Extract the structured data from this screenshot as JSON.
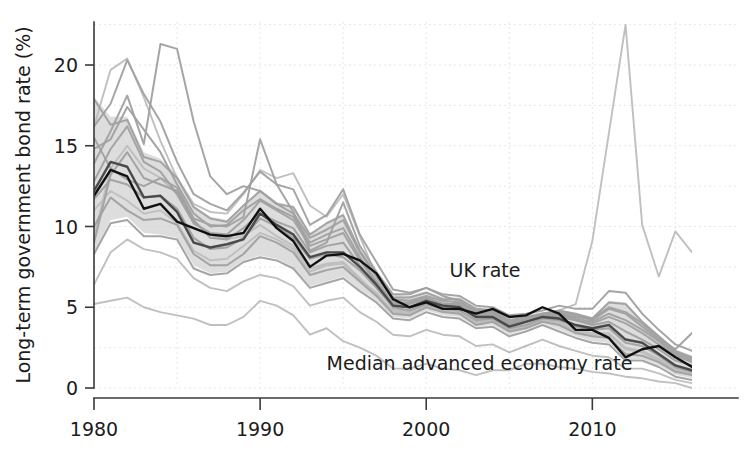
{
  "chart_data": {
    "type": "line",
    "title": "",
    "xlabel": "",
    "ylabel": "Long-term government bond rate (%)",
    "xlim": [
      1980,
      2016
    ],
    "ylim": [
      0,
      23
    ],
    "grid": true,
    "legend_position": "inline-annotations",
    "y_ticks": [
      0,
      5,
      10,
      15,
      20
    ],
    "y_tick_labels": [
      "0",
      "5",
      "10",
      "15",
      "20"
    ],
    "x_ticks": [
      1980,
      1990,
      2000,
      2010
    ],
    "x_tick_labels": [
      "1980",
      "1990",
      "2000",
      "2010"
    ],
    "y_gridlines": [
      2.5,
      7.5,
      12.5,
      17.5,
      22.5
    ],
    "x_gridlines": [
      1985,
      1995,
      2005,
      2015
    ],
    "colors": {
      "uk_line": "#111111",
      "median_line": "#4a4a4a",
      "country_line": "#a0a0a0",
      "country_line_light": "#bdbdbd",
      "band_fill": "#d2d2d2",
      "grid": "#d9dde2",
      "axis": "#3a3a3a",
      "text": "#1c1c1c",
      "background": "#ffffff"
    },
    "annotations": [
      {
        "name": "uk-rate-label",
        "text": "UK rate",
        "x": 2001.4,
        "y": 6.9
      },
      {
        "name": "median-rate-label",
        "text": "Median advanced economy rate",
        "x": 1994.0,
        "y": 1.1
      }
    ],
    "x": [
      1980,
      1981,
      1982,
      1983,
      1984,
      1985,
      1986,
      1987,
      1988,
      1989,
      1990,
      1991,
      1992,
      1993,
      1994,
      1995,
      1996,
      1997,
      1998,
      1999,
      2000,
      2001,
      2002,
      2003,
      2004,
      2005,
      2006,
      2007,
      2008,
      2009,
      2010,
      2011,
      2012,
      2013,
      2014,
      2015,
      2016
    ],
    "band": {
      "name": "Interquartile range of advanced economies",
      "lower": [
        8.4,
        10.4,
        10.6,
        9.6,
        9.5,
        9.3,
        7.6,
        7.1,
        7.2,
        7.9,
        8.2,
        8.0,
        7.5,
        6.3,
        6.6,
        6.9,
        6.1,
        5.4,
        4.4,
        4.3,
        4.8,
        4.5,
        4.4,
        3.8,
        3.9,
        3.3,
        3.6,
        4.0,
        3.6,
        3.2,
        2.9,
        2.8,
        1.8,
        1.8,
        1.4,
        0.8,
        0.6
      ],
      "upper": [
        18.0,
        16.8,
        16.8,
        14.6,
        14.2,
        13.2,
        11.3,
        10.6,
        10.4,
        11.3,
        12.3,
        11.5,
        11.3,
        9.6,
        10.2,
        10.8,
        8.6,
        7.1,
        5.8,
        5.7,
        6.0,
        5.6,
        5.6,
        5.0,
        4.9,
        4.3,
        4.5,
        4.7,
        4.8,
        4.6,
        4.4,
        5.4,
        5.3,
        4.2,
        3.3,
        2.4,
        2.0
      ]
    },
    "series": [
      {
        "name": "UK rate",
        "style": "uk",
        "values": [
          11.9,
          13.5,
          13.1,
          11.1,
          11.4,
          10.3,
          9.9,
          9.5,
          9.4,
          9.6,
          11.1,
          9.9,
          9.1,
          7.5,
          8.2,
          8.3,
          7.9,
          7.1,
          5.5,
          5.0,
          5.3,
          4.9,
          4.9,
          4.6,
          4.9,
          4.4,
          4.5,
          5.0,
          4.6,
          3.6,
          3.6,
          3.1,
          1.9,
          2.4,
          2.6,
          1.9,
          1.3
        ]
      },
      {
        "name": "Median advanced economy rate",
        "style": "median",
        "values": [
          12.2,
          14.0,
          13.7,
          11.8,
          11.9,
          10.9,
          9.0,
          8.7,
          8.9,
          9.2,
          10.8,
          10.1,
          9.5,
          8.1,
          8.4,
          8.4,
          7.5,
          6.4,
          5.1,
          5.0,
          5.4,
          5.1,
          5.0,
          4.4,
          4.4,
          3.8,
          4.1,
          4.4,
          4.3,
          3.9,
          3.7,
          3.9,
          3.0,
          2.8,
          2.1,
          1.4,
          1.1
        ]
      },
      {
        "name": "Country series 1",
        "style": "country",
        "values": [
          17.9,
          16.3,
          16.6,
          14.3,
          14.0,
          13.0,
          11.2,
          10.5,
          10.3,
          11.3,
          12.2,
          11.4,
          11.2,
          9.5,
          10.2,
          10.7,
          8.5,
          7.0,
          5.6,
          5.6,
          5.9,
          5.5,
          5.5,
          4.9,
          4.8,
          4.2,
          4.4,
          4.6,
          4.8,
          4.6,
          4.3,
          5.3,
          5.2,
          4.1,
          3.2,
          2.3,
          1.9
        ]
      },
      {
        "name": "Country series 2",
        "style": "country",
        "values": [
          16.2,
          17.6,
          20.3,
          18.2,
          16.5,
          14.0,
          12.0,
          11.4,
          11.0,
          12.1,
          13.4,
          12.6,
          12.3,
          10.1,
          10.7,
          12.3,
          9.5,
          7.8,
          6.1,
          5.9,
          6.2,
          5.8,
          5.7,
          5.1,
          5.0,
          4.5,
          4.6,
          4.8,
          5.1,
          4.9,
          4.9,
          6.0,
          5.9,
          4.6,
          3.6,
          2.7,
          2.3
        ]
      },
      {
        "name": "Country series 3",
        "style": "country",
        "values": [
          14.8,
          15.4,
          17.4,
          16.0,
          14.6,
          12.6,
          10.8,
          10.0,
          10.1,
          11.0,
          11.7,
          11.1,
          10.6,
          9.0,
          9.5,
          9.9,
          8.1,
          6.6,
          5.3,
          5.3,
          5.6,
          5.2,
          5.2,
          4.6,
          4.6,
          4.0,
          4.2,
          4.5,
          4.6,
          4.3,
          4.1,
          4.6,
          4.2,
          3.6,
          2.9,
          2.1,
          1.7
        ]
      },
      {
        "name": "Country series 4",
        "style": "country",
        "values": [
          13.9,
          15.9,
          18.1,
          15.1,
          21.3,
          21.0,
          16.5,
          13.1,
          12.0,
          12.5,
          12.2,
          11.4,
          10.8,
          9.3,
          9.8,
          10.4,
          8.4,
          6.9,
          5.5,
          5.4,
          5.7,
          5.4,
          5.3,
          4.8,
          4.7,
          4.1,
          4.3,
          4.6,
          4.7,
          4.5,
          4.2,
          4.9,
          4.6,
          3.8,
          3.0,
          2.2,
          1.8
        ]
      },
      {
        "name": "Country series 5",
        "style": "country",
        "values": [
          9.0,
          13.2,
          14.6,
          13.0,
          12.6,
          12.2,
          10.4,
          9.3,
          9.2,
          9.9,
          10.8,
          10.3,
          9.9,
          8.4,
          8.8,
          9.0,
          7.6,
          6.3,
          5.1,
          5.0,
          5.4,
          5.0,
          5.0,
          4.4,
          4.4,
          3.9,
          4.1,
          4.4,
          4.4,
          4.2,
          3.9,
          4.1,
          3.5,
          3.0,
          2.4,
          1.7,
          1.4
        ]
      },
      {
        "name": "Country series 6",
        "style": "country",
        "values": [
          11.7,
          12.9,
          12.6,
          11.8,
          11.9,
          11.1,
          9.3,
          8.6,
          8.7,
          9.3,
          10.5,
          10.0,
          9.3,
          8.0,
          8.3,
          8.1,
          7.3,
          6.2,
          5.0,
          4.8,
          5.2,
          4.9,
          4.8,
          4.2,
          4.3,
          3.7,
          3.9,
          4.3,
          4.2,
          3.8,
          3.6,
          3.7,
          2.8,
          2.6,
          2.0,
          1.3,
          1.0
        ]
      },
      {
        "name": "Country series 7",
        "style": "country",
        "values": [
          10.0,
          11.8,
          11.0,
          10.4,
          10.5,
          10.1,
          8.3,
          7.6,
          7.6,
          8.3,
          9.4,
          9.0,
          8.4,
          7.0,
          7.3,
          7.5,
          6.6,
          5.7,
          4.6,
          4.5,
          5.0,
          4.7,
          4.6,
          3.9,
          4.1,
          3.5,
          3.7,
          4.1,
          3.9,
          3.4,
          3.2,
          3.1,
          2.1,
          2.0,
          1.6,
          1.0,
          0.8
        ]
      },
      {
        "name": "Country series 8",
        "style": "country",
        "values": [
          8.3,
          10.2,
          10.4,
          9.4,
          9.4,
          9.2,
          7.4,
          7.0,
          7.1,
          7.8,
          8.1,
          7.9,
          7.4,
          6.2,
          6.5,
          6.8,
          6.0,
          5.3,
          4.3,
          4.2,
          4.7,
          4.4,
          4.3,
          3.7,
          3.8,
          3.2,
          3.5,
          3.9,
          3.5,
          3.1,
          2.8,
          2.7,
          1.7,
          1.7,
          1.3,
          0.7,
          0.5
        ]
      },
      {
        "name": "Country series 9",
        "style": "country-light",
        "values": [
          5.2,
          5.4,
          5.6,
          5.0,
          4.7,
          4.5,
          4.3,
          3.9,
          3.9,
          4.4,
          5.4,
          5.1,
          4.5,
          3.3,
          3.7,
          2.9,
          2.5,
          2.0,
          1.2,
          1.2,
          1.5,
          1.2,
          1.1,
          0.8,
          1.1,
          1.1,
          1.5,
          1.5,
          1.3,
          1.2,
          1.0,
          0.9,
          0.7,
          0.6,
          0.4,
          0.3,
          0.0
        ]
      },
      {
        "name": "Country series 10",
        "style": "country-light",
        "values": [
          9.4,
          13.6,
          15.0,
          13.6,
          13.0,
          12.0,
          10.3,
          9.5,
          9.2,
          9.4,
          10.1,
          9.4,
          8.8,
          7.4,
          7.7,
          7.8,
          6.8,
          5.8,
          4.8,
          4.7,
          5.1,
          4.8,
          4.7,
          4.1,
          4.2,
          3.6,
          3.8,
          4.2,
          4.1,
          3.6,
          3.4,
          3.4,
          2.5,
          2.3,
          1.8,
          1.2,
          1.0
        ]
      },
      {
        "name": "Country series 11 (peripheral spike)",
        "style": "country-light",
        "values": [
          16.2,
          19.7,
          20.4,
          18.0,
          15.3,
          13.0,
          11.4,
          10.9,
          10.8,
          12.0,
          13.5,
          13.0,
          13.3,
          11.3,
          10.6,
          12.0,
          9.4,
          6.9,
          4.9,
          4.7,
          5.5,
          5.3,
          5.1,
          4.3,
          4.3,
          3.6,
          4.1,
          4.5,
          4.8,
          5.2,
          9.1,
          15.8,
          22.5,
          10.1,
          6.9,
          9.7,
          8.4
        ]
      },
      {
        "name": "Country series 12",
        "style": "country",
        "values": [
          12.8,
          14.8,
          16.2,
          14.0,
          13.4,
          12.0,
          10.2,
          9.6,
          9.5,
          10.4,
          11.6,
          11.0,
          10.4,
          8.8,
          9.2,
          9.6,
          7.9,
          6.5,
          5.2,
          5.2,
          5.5,
          5.1,
          5.1,
          4.5,
          4.5,
          3.9,
          4.2,
          4.5,
          4.5,
          4.2,
          4.0,
          4.4,
          4.0,
          3.4,
          2.7,
          2.0,
          1.6
        ]
      },
      {
        "name": "Country series 13",
        "style": "country",
        "values": [
          15.5,
          13.6,
          12.9,
          12.5,
          13.0,
          12.4,
          10.5,
          10.1,
          10.0,
          10.6,
          15.4,
          12.6,
          10.9,
          8.5,
          9.0,
          11.5,
          8.8,
          7.2,
          5.8,
          5.8,
          6.2,
          5.7,
          5.4,
          4.7,
          4.7,
          4.0,
          4.2,
          4.6,
          4.6,
          4.4,
          4.3,
          5.0,
          4.7,
          4.0,
          3.1,
          2.4,
          3.4
        ]
      },
      {
        "name": "Country series 14",
        "style": "country-light",
        "values": [
          11.0,
          12.2,
          11.6,
          10.8,
          11.0,
          10.2,
          8.5,
          7.9,
          8.0,
          8.8,
          9.6,
          9.2,
          8.6,
          7.2,
          7.6,
          7.7,
          6.7,
          5.9,
          4.7,
          4.6,
          5.1,
          4.8,
          4.7,
          4.0,
          4.2,
          3.6,
          3.8,
          4.2,
          4.0,
          3.5,
          3.3,
          3.3,
          2.4,
          2.2,
          1.7,
          1.1,
          0.9
        ]
      },
      {
        "name": "Country series 15",
        "style": "country-light",
        "values": [
          6.4,
          8.4,
          9.2,
          8.6,
          8.4,
          8.0,
          6.8,
          6.2,
          6.0,
          6.6,
          7.0,
          6.8,
          6.3,
          5.1,
          5.4,
          5.6,
          4.7,
          4.1,
          3.3,
          3.2,
          3.6,
          3.3,
          3.2,
          2.6,
          2.7,
          2.2,
          2.6,
          3.0,
          2.6,
          2.3,
          2.0,
          1.9,
          1.2,
          1.2,
          0.9,
          0.5,
          0.3
        ]
      }
    ]
  }
}
